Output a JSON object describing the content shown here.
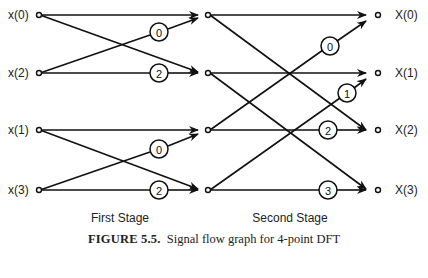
{
  "figure": {
    "inputs": [
      "x(0)",
      "x(2)",
      "x(1)",
      "x(3)"
    ],
    "outputs": [
      "X(0)",
      "X(1)",
      "X(2)",
      "X(3)"
    ],
    "stages": [
      "First Stage",
      "Second Stage"
    ],
    "first_stage_twiddles": [
      "0",
      "2",
      "0",
      "2"
    ],
    "second_stage_twiddles": [
      "0",
      "1",
      "2",
      "3"
    ],
    "caption_label": "FIGURE 5.5.",
    "caption_text": "Signal flow graph for 4-point DFT"
  }
}
